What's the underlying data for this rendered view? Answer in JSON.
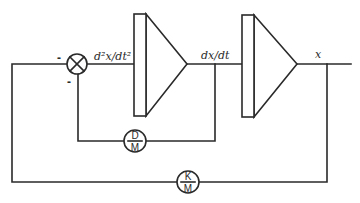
{
  "diagram": {
    "type": "block-diagram",
    "summing_junction": {
      "signs": {
        "left": "-",
        "bottom": "-"
      }
    },
    "signals": {
      "acceleration": "d²x/dt²",
      "velocity": "dx/dt",
      "position": "x"
    },
    "integrators": [
      {
        "id": "integrator-1",
        "input": "d²x/dt²",
        "output": "dx/dt"
      },
      {
        "id": "integrator-2",
        "input": "dx/dt",
        "output": "x"
      }
    ],
    "gains": {
      "damping": {
        "numerator": "D",
        "denominator": "M"
      },
      "spring": {
        "numerator": "K",
        "denominator": "M"
      }
    },
    "colors": {
      "stroke": "#2a2a2a",
      "background": "#ffffff"
    }
  }
}
